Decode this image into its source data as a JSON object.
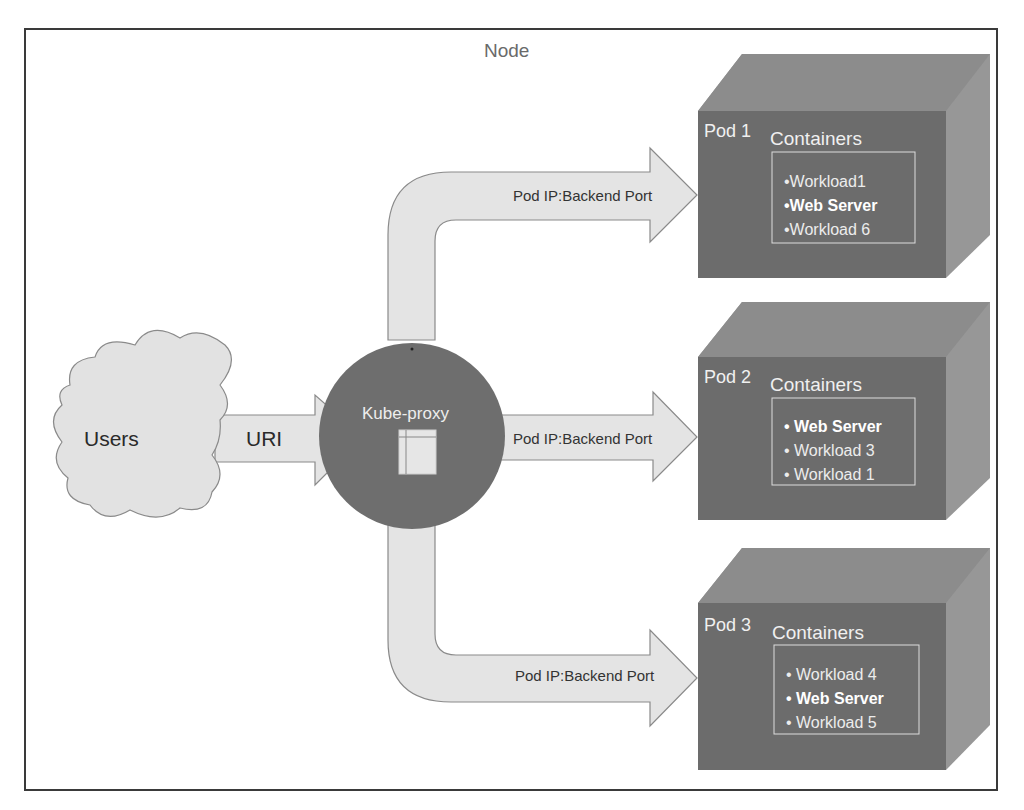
{
  "diagram": {
    "title": "Node",
    "users": {
      "label": "Users"
    },
    "uri_arrow": {
      "label": "URI"
    },
    "kube_proxy": {
      "label": "Kube-proxy"
    },
    "routes": [
      {
        "label": "Pod IP:Backend Port",
        "target": "Pod 1"
      },
      {
        "label": "Pod IP:Backend Port",
        "target": "Pod 2"
      },
      {
        "label": "Pod IP:Backend Port",
        "target": "Pod 3"
      }
    ],
    "pods": [
      {
        "name": "Pod 1",
        "containers_label": "Containers",
        "workloads": [
          {
            "text": "•Workload1",
            "bold": false
          },
          {
            "text": "•Web Server",
            "bold": true
          },
          {
            "text": "•Workload 6",
            "bold": false
          }
        ]
      },
      {
        "name": "Pod 2",
        "containers_label": "Containers",
        "workloads": [
          {
            "text": "• Web Server",
            "bold": true
          },
          {
            "text": "• Workload 3",
            "bold": false
          },
          {
            "text": "• Workload 1",
            "bold": false
          }
        ]
      },
      {
        "name": "Pod 3",
        "containers_label": "Containers",
        "workloads": [
          {
            "text": "• Workload 4",
            "bold": false
          },
          {
            "text": "• Web Server",
            "bold": true
          },
          {
            "text": "• Workload 5",
            "bold": false
          }
        ]
      }
    ],
    "colors": {
      "frame": "#3a3a3a",
      "arrow_fill": "#e4e4e4",
      "arrow_stroke": "#8a8a8a",
      "cloud_fill": "#e2e2e2",
      "proxy_circle": "#6e6e6e",
      "cube_front": "#6c6c6c",
      "cube_top": "#8e8e8e",
      "cube_side": "#999999"
    }
  }
}
